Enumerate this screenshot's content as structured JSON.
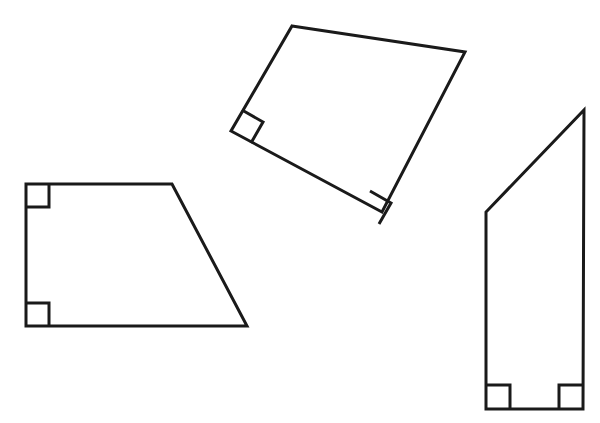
{
  "page": {
    "width": 600,
    "height": 423,
    "background_color": "#ffffff",
    "stroke_color": "#1a1a1a",
    "stroke_width": 3,
    "clipped_header_text": "········· ··· ·········"
  },
  "figure": {
    "type": "geometry-diagram",
    "shape_count": 3,
    "shapes": [
      {
        "id": "shape-left",
        "name": "left-trapezoid",
        "label": "Left right trapezoid",
        "sides": 4,
        "right_angle_count": 2,
        "points": "26,184 172,184 247,326 26,326",
        "fill": "#ffffff",
        "angle_markers": [
          {
            "name": "right-angle-marker-top-left",
            "points": "49,184 49,207 26,207"
          },
          {
            "name": "right-angle-marker-bottom-left",
            "points": "26,303 49,303 49,326"
          }
        ]
      },
      {
        "id": "shape-top",
        "name": "rotated-trapezoid",
        "label": "Top rotated right trapezoid",
        "sides": 4,
        "right_angle_count": 2,
        "points": "292,26 465,52 382,212 231,131",
        "fill": "#ffffff",
        "angle_markers": [
          {
            "name": "right-angle-marker-rotated-left",
            "points": "242,110 263,122 251,143"
          },
          {
            "name": "right-angle-marker-rotated-bottom",
            "points": "370,191 391,203 379,224"
          }
        ]
      },
      {
        "id": "shape-right",
        "name": "tall-trapezoid",
        "label": "Right tall right trapezoid",
        "sides": 4,
        "right_angle_count": 2,
        "points": "584,110 583,409 486,409 486,212",
        "fill": "#ffffff",
        "angle_markers": [
          {
            "name": "right-angle-marker-bottom-left-tall",
            "points": "486,385 510,385 510,409"
          },
          {
            "name": "right-angle-marker-bottom-right-tall",
            "points": "583,385 559,385 559,409"
          }
        ]
      }
    ]
  }
}
